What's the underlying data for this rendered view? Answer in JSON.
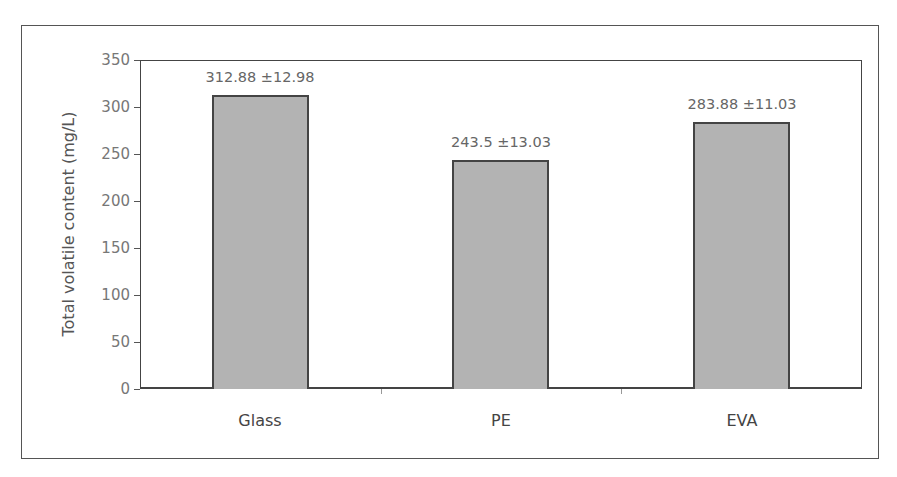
{
  "chart_data": {
    "type": "bar",
    "title": "",
    "xlabel": "",
    "ylabel": "Total volatile content (mg/L)",
    "categories": [
      "Glass",
      "PE",
      "EVA"
    ],
    "values": [
      312.88,
      243.5,
      283.88
    ],
    "errors": [
      12.98,
      13.03,
      11.03
    ],
    "data_labels": [
      "312.88 ±12.98",
      "243.5 ±13.03",
      "283.88 ±11.03"
    ],
    "ylim": [
      0,
      350
    ],
    "yticks": [
      0,
      50,
      100,
      150,
      200,
      250,
      300,
      350
    ],
    "grid": false,
    "legend": null,
    "bar_color": "#b3b3b3",
    "bar_edge_color": "#444444"
  }
}
